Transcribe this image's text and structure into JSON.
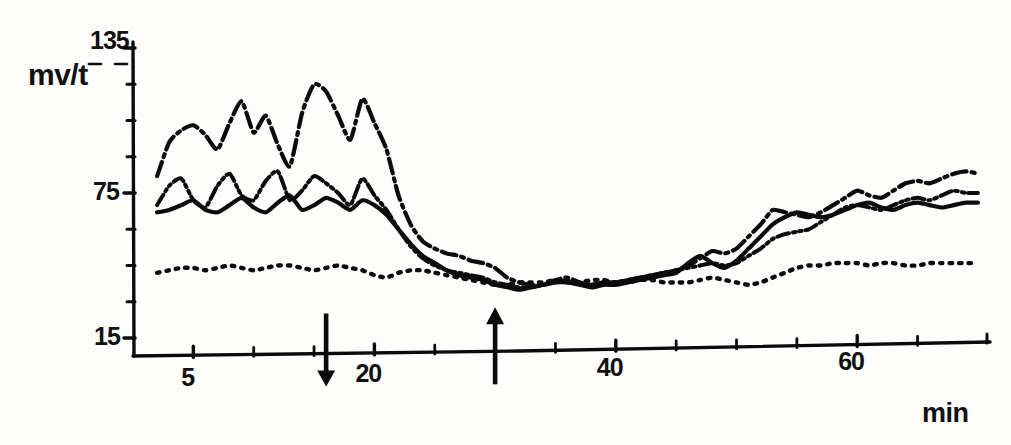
{
  "chart_data": {
    "type": "line",
    "title": "",
    "xlabel": "min",
    "ylabel": "mv/t",
    "xlim": [
      0,
      71
    ],
    "ylim": [
      15,
      135
    ],
    "grid": false,
    "legend": "none",
    "y_ticks_labeled": [
      15,
      75,
      135
    ],
    "y_ticks_minor": [
      30,
      45,
      60,
      90,
      105,
      120
    ],
    "x_ticks_labeled": [
      5,
      20,
      40,
      60
    ],
    "x_ticks_minor": [
      10,
      15,
      25,
      30,
      35,
      45,
      50,
      55,
      65
    ],
    "annotations": [
      {
        "name": "down-arrow-marker",
        "x": 16,
        "direction": "down",
        "label": ""
      },
      {
        "name": "up-arrow-marker",
        "x": 30,
        "direction": "up",
        "label": ""
      }
    ],
    "series": [
      {
        "name": "trace-1",
        "style": "dash-dot",
        "x": [
          2,
          3,
          4,
          5,
          6,
          7,
          8,
          9,
          10,
          11,
          12,
          13,
          14,
          15,
          16,
          17,
          18,
          19,
          20,
          21,
          22,
          23,
          24,
          25,
          26,
          27,
          28,
          29,
          30,
          31,
          32,
          33,
          34,
          35,
          36,
          37,
          38,
          39,
          40,
          41,
          42,
          43,
          44,
          45,
          46,
          47,
          48,
          49,
          50,
          51,
          52,
          53,
          54,
          55,
          56,
          57,
          58,
          59,
          60,
          61,
          62,
          63,
          64,
          65,
          66,
          67,
          68,
          69,
          70
        ],
        "values": [
          82,
          96,
          101,
          103,
          99,
          93,
          104,
          113,
          100,
          107,
          95,
          86,
          108,
          120,
          117,
          107,
          97,
          114,
          104,
          93,
          74,
          62,
          55,
          52,
          50,
          49,
          47,
          46,
          44,
          40,
          38,
          37,
          37,
          39,
          40,
          38,
          37,
          38,
          38,
          39,
          40,
          41,
          42,
          43,
          45,
          48,
          51,
          50,
          52,
          57,
          62,
          68,
          67,
          66,
          65,
          67,
          70,
          73,
          76,
          74,
          73,
          76,
          79,
          80,
          79,
          81,
          83,
          84,
          83
        ],
        "y_first": 82,
        "y_last": 83,
        "y_max": 120,
        "y_min": 37
      },
      {
        "name": "trace-2",
        "style": "dash-dot-dot",
        "x": [
          2,
          3,
          4,
          5,
          6,
          7,
          8,
          9,
          10,
          11,
          12,
          13,
          14,
          15,
          16,
          17,
          18,
          19,
          20,
          21,
          22,
          23,
          24,
          25,
          26,
          27,
          28,
          29,
          30,
          31,
          32,
          33,
          34,
          35,
          36,
          37,
          38,
          39,
          40,
          41,
          42,
          43,
          44,
          45,
          46,
          47,
          48,
          49,
          50,
          51,
          52,
          53,
          54,
          55,
          56,
          57,
          58,
          59,
          60,
          61,
          62,
          63,
          64,
          65,
          66,
          67,
          68,
          69,
          70
        ],
        "values": [
          70,
          78,
          81,
          72,
          69,
          78,
          83,
          74,
          72,
          80,
          84,
          72,
          76,
          82,
          79,
          75,
          70,
          81,
          74,
          68,
          60,
          53,
          48,
          45,
          43,
          42,
          41,
          40,
          38,
          37,
          36,
          36,
          37,
          38,
          39,
          38,
          37,
          38,
          38,
          39,
          40,
          41,
          42,
          43,
          44,
          45,
          46,
          45,
          46,
          49,
          52,
          56,
          58,
          59,
          60,
          63,
          66,
          69,
          70,
          69,
          68,
          70,
          72,
          73,
          72,
          74,
          76,
          75,
          75
        ],
        "y_first": 70,
        "y_last": 75,
        "y_max": 84,
        "y_min": 36
      },
      {
        "name": "trace-3",
        "style": "solid",
        "x": [
          2,
          3,
          4,
          5,
          6,
          7,
          8,
          9,
          10,
          11,
          12,
          13,
          14,
          15,
          16,
          17,
          18,
          19,
          20,
          21,
          22,
          23,
          24,
          25,
          26,
          27,
          28,
          29,
          30,
          31,
          32,
          33,
          34,
          35,
          36,
          37,
          38,
          39,
          40,
          41,
          42,
          43,
          44,
          45,
          46,
          47,
          48,
          49,
          50,
          51,
          52,
          53,
          54,
          55,
          56,
          57,
          58,
          59,
          60,
          61,
          62,
          63,
          64,
          65,
          66,
          67,
          68,
          69,
          70
        ],
        "values": [
          67,
          68,
          70,
          72,
          68,
          67,
          70,
          73,
          69,
          67,
          71,
          74,
          68,
          70,
          73,
          71,
          68,
          72,
          70,
          66,
          60,
          54,
          49,
          46,
          43,
          41,
          40,
          39,
          37,
          36,
          35,
          36,
          37,
          38,
          38,
          37,
          36,
          37,
          37,
          38,
          39,
          40,
          41,
          42,
          46,
          49,
          46,
          44,
          47,
          52,
          57,
          62,
          65,
          67,
          66,
          65,
          66,
          68,
          70,
          71,
          69,
          68,
          70,
          71,
          70,
          69,
          70,
          71,
          71
        ],
        "y_first": 67,
        "y_last": 71,
        "y_max": 74,
        "y_min": 35
      },
      {
        "name": "trace-4",
        "style": "dotted",
        "x": [
          2,
          3,
          4,
          5,
          6,
          7,
          8,
          9,
          10,
          11,
          12,
          13,
          14,
          15,
          16,
          17,
          18,
          19,
          20,
          21,
          22,
          23,
          24,
          25,
          26,
          27,
          28,
          29,
          30,
          31,
          32,
          33,
          34,
          35,
          36,
          37,
          38,
          39,
          40,
          41,
          42,
          43,
          44,
          45,
          46,
          47,
          48,
          49,
          50,
          51,
          52,
          53,
          54,
          55,
          56,
          57,
          58,
          59,
          60,
          61,
          62,
          63,
          64,
          65,
          66,
          67,
          68,
          69,
          70
        ],
        "values": [
          42,
          43,
          44,
          44,
          43,
          44,
          45,
          44,
          43,
          44,
          45,
          45,
          44,
          43,
          44,
          45,
          44,
          43,
          41,
          40,
          42,
          43,
          43,
          42,
          41,
          40,
          39,
          38,
          37,
          37,
          38,
          38,
          38,
          39,
          38,
          38,
          39,
          39,
          38,
          38,
          39,
          39,
          38,
          38,
          38,
          39,
          40,
          39,
          38,
          37,
          38,
          40,
          42,
          44,
          45,
          45,
          46,
          46,
          46,
          45,
          46,
          46,
          45,
          45,
          46,
          46,
          46,
          46,
          46
        ],
        "y_first": 42,
        "y_last": 46,
        "y_max": 46,
        "y_min": 37
      }
    ]
  },
  "axes": {
    "y_label": "mv/t",
    "x_label": "min",
    "y_tick_labels": [
      "135",
      "75",
      "15"
    ],
    "x_tick_labels": [
      "5",
      "20",
      "40",
      "60"
    ]
  },
  "colors": {
    "ink": "#0b0b0b",
    "background": "#fdfdfc"
  }
}
